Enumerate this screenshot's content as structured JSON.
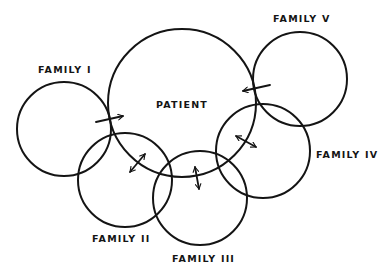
{
  "diagram": {
    "type": "overlapping-circles",
    "nodes": [
      {
        "id": "patient",
        "label": "PATIENT"
      },
      {
        "id": "family1",
        "label": "FAMILY I"
      },
      {
        "id": "family2",
        "label": "FAMILY II"
      },
      {
        "id": "family3",
        "label": "FAMILY III"
      },
      {
        "id": "family4",
        "label": "FAMILY IV"
      },
      {
        "id": "family5",
        "label": "FAMILY V"
      }
    ],
    "edges": [
      {
        "from": "family1",
        "to": "patient",
        "direction": "one-way"
      },
      {
        "from": "family5",
        "to": "patient",
        "direction": "one-way"
      },
      {
        "from": "family2",
        "to": "patient",
        "direction": "two-way"
      },
      {
        "from": "family3",
        "to": "patient",
        "direction": "two-way"
      },
      {
        "from": "family4",
        "to": "patient",
        "direction": "two-way"
      }
    ],
    "colors": {
      "stroke": "#141414",
      "background": "#ffffff"
    }
  }
}
